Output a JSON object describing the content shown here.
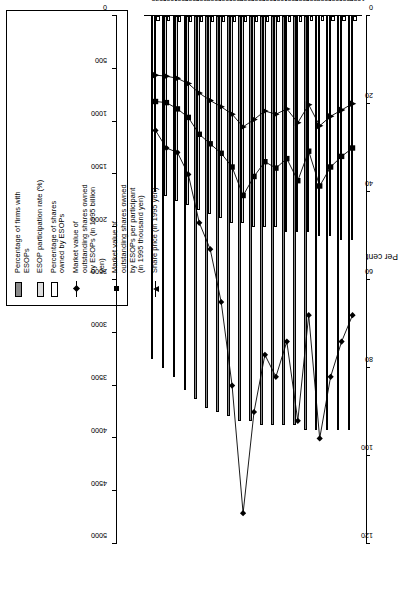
{
  "figure": {
    "left_axis_title": "Per cent",
    "left_axis_ticks": [
      "0",
      "20",
      "40",
      "60",
      "80",
      "100",
      "120"
    ],
    "right_axis_ticks": [
      "0",
      "500",
      "1000",
      "1500",
      "2000",
      "2500",
      "3000",
      "3500",
      "4000",
      "4500",
      "5000"
    ]
  },
  "legend": {
    "items": [
      {
        "key": "swatch-dark",
        "label": "Percentage of firms with\nESOPs"
      },
      {
        "key": "swatch-light",
        "label": "ESOP participation rate (%)"
      },
      {
        "key": "swatch-white",
        "label": "Percentage of shares\nowned by ESOPs"
      },
      {
        "key": "marker-diamond",
        "label": "Market value of\noutstanding shares owned\nby ESOPs (in 1995 billion\nyen)"
      },
      {
        "key": "marker-square",
        "label": "Market value of\noutstanding shares owned\nby ESOPs per participant\n(in 1995 thousand yen)"
      },
      {
        "key": "marker-triangle",
        "label": "Share price (in 1995 yen)"
      }
    ]
  },
  "chart_data": {
    "type": "bar",
    "title": "",
    "subtitle": "",
    "xlabel": "",
    "ylabel": "Per cent",
    "y2label": "",
    "grid": false,
    "legend_position": "top-right",
    "orientation": "horizontal",
    "categories": [
      "1979",
      "1980",
      "1981",
      "1982",
      "1983",
      "1984",
      "1985",
      "1986",
      "1987",
      "1988",
      "1989",
      "1990",
      "1991",
      "1992",
      "1993",
      "1994",
      "1995",
      "1996",
      "1997"
    ],
    "ylim": [
      0,
      120
    ],
    "y2lim": [
      0,
      5000
    ],
    "series": [
      {
        "name": "Percentage of firms with ESOPs",
        "type": "bar",
        "axis": "left",
        "color": "#8a8a8a",
        "values": [
          78,
          80,
          82,
          85,
          87,
          89,
          90,
          91,
          92,
          92,
          93,
          93,
          93,
          93,
          94,
          94,
          94,
          94,
          94
        ]
      },
      {
        "name": "ESOP participation rate (%)",
        "type": "bar",
        "axis": "left",
        "color": "#dcdcdc",
        "values": [
          40,
          41,
          42,
          43,
          44,
          45,
          46,
          47,
          47,
          48,
          48,
          48,
          49,
          49,
          49,
          50,
          50,
          51,
          51
        ]
      },
      {
        "name": "Percentage of shares owned by ESOPs",
        "type": "bar",
        "axis": "left",
        "color": "#ffffff",
        "values": [
          1.2,
          1.2,
          1.3,
          1.3,
          1.4,
          1.4,
          1.4,
          1.4,
          1.3,
          1.3,
          1.3,
          1.3,
          1.3,
          1.3,
          1.2,
          1.2,
          1.2,
          1.2,
          1.2
        ]
      },
      {
        "name": "Market value of outstanding shares owned by ESOPs (in 1995 billion yen)",
        "type": "line",
        "axis": "left",
        "marker": "diamond",
        "color": "#000000",
        "values": [
          26,
          30,
          31,
          36,
          47,
          53,
          65,
          84,
          113,
          90,
          77,
          82,
          74,
          92,
          68,
          96,
          82,
          74,
          68
        ]
      },
      {
        "name": "Market value of outstanding shares owned by ESOPs per participant (in 1995 thousand yen)",
        "type": "line",
        "axis": "right",
        "marker": "square",
        "color": "#000000",
        "values": [
          810,
          820,
          880,
          960,
          1120,
          1210,
          1300,
          1430,
          1700,
          1520,
          1380,
          1440,
          1350,
          1560,
          1280,
          1610,
          1430,
          1330,
          1250
        ]
      },
      {
        "name": "Share price (in 1995 yen)",
        "type": "line",
        "axis": "right",
        "marker": "triangle",
        "color": "#000000",
        "values": [
          560,
          570,
          590,
          640,
          730,
          800,
          860,
          930,
          1050,
          980,
          900,
          930,
          880,
          1010,
          840,
          1040,
          950,
          890,
          830
        ]
      }
    ]
  }
}
